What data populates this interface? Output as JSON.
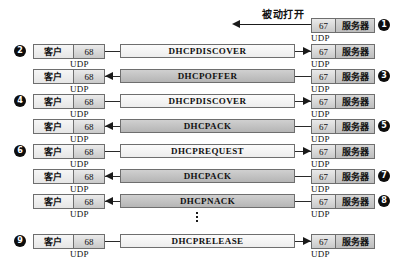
{
  "figure": {
    "annotation": {
      "label": "被动打开",
      "direction": "left"
    },
    "client_label": "客户",
    "server_label": "服务器",
    "client_port": "68",
    "server_port": "67",
    "transport_label": "UDP",
    "ellipsis": "⋮",
    "colors": {
      "to_server_fill": "#f4f4f4",
      "to_client_fill": "#c3c3c3",
      "node_border": "#6e6e6e",
      "line": "#1a1a1a",
      "bullet_fill": "#0d0d0d",
      "bullet_text": "#ffffff",
      "background": "#ffffff"
    }
  },
  "rows": [
    {
      "step": "❶",
      "step_number": "1",
      "step_side": "right",
      "kind": "annotation-only",
      "message": "",
      "direction": "to-client",
      "has_client": false,
      "has_server": true
    },
    {
      "step": "❷",
      "step_number": "2",
      "step_side": "left",
      "kind": "message",
      "message": "DHCPDISCOVER",
      "direction": "to-server",
      "has_client": true,
      "has_server": true
    },
    {
      "step": "❸",
      "step_number": "3",
      "step_side": "right",
      "kind": "message",
      "message": "DHCPOFFER",
      "direction": "to-client",
      "has_client": true,
      "has_server": true
    },
    {
      "step": "❹",
      "step_number": "4",
      "step_side": "left",
      "kind": "message",
      "message": "DHCPDISCOVER",
      "direction": "to-server",
      "has_client": true,
      "has_server": true
    },
    {
      "step": "❺",
      "step_number": "5",
      "step_side": "right",
      "kind": "message",
      "message": "DHCPACK",
      "direction": "to-client",
      "has_client": true,
      "has_server": true
    },
    {
      "step": "❻",
      "step_number": "6",
      "step_side": "left",
      "kind": "message",
      "message": "DHCPREQUEST",
      "direction": "to-server",
      "has_client": true,
      "has_server": true
    },
    {
      "step": "❼",
      "step_number": "7",
      "step_side": "right",
      "kind": "message",
      "message": "DHCPACK",
      "direction": "to-client",
      "has_client": true,
      "has_server": true
    },
    {
      "step": "❽",
      "step_number": "8",
      "step_side": "right",
      "kind": "message",
      "message": "DHCPNACK",
      "direction": "to-client",
      "has_client": true,
      "has_server": true
    },
    {
      "step": "❾",
      "step_number": "9",
      "step_side": "left",
      "kind": "message",
      "message": "DHCPRELEASE",
      "direction": "to-server",
      "has_client": true,
      "has_server": true
    }
  ]
}
